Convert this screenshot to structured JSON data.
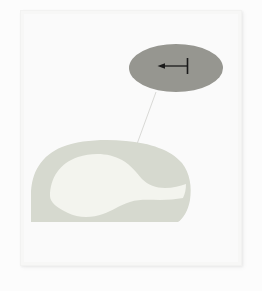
{
  "figure": {
    "title": "Histological cross-section with magnified inset",
    "background_color": "#fcfcfc",
    "panel": {
      "name": "figure-panel",
      "fill_color": "#f7f7f6",
      "plate_color": "#fafafa",
      "border_color": "#f2f2f1",
      "x": 20,
      "y": 10,
      "width": 222,
      "height": 256
    },
    "specimen": {
      "label": "tissue-cross-section",
      "tissue_color": "#d6d9cf",
      "lumen_color": "#f3f4ee",
      "outline": "dome-shaped cross-section with flat ventral border",
      "bounds": {
        "x": 30,
        "y": 140,
        "width": 160,
        "height": 84
      }
    },
    "inset": {
      "label": "magnified-inset",
      "shape": "ellipse",
      "fill_color": "#969690",
      "center_x": 176,
      "center_y": 68,
      "radius_x": 47,
      "radius_y": 24,
      "annotation": {
        "label": "scale-bar-arrow",
        "type": "arrow-with-end-tick",
        "direction": "left",
        "color": "#1a1a1a",
        "start_x": 188,
        "end_x": 158,
        "y": 66
      }
    },
    "leader_line": {
      "label": "inset-leader-line",
      "color": "#d9d9d6",
      "from_x": 156,
      "from_y": 92,
      "to_x": 137,
      "to_y": 144
    }
  }
}
